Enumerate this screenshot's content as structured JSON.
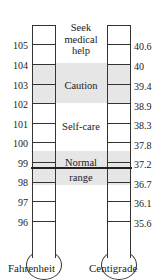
{
  "fahrenheit": {
    "title": "Fahrenheit",
    "ticks": [
      "105",
      "104",
      "103",
      "102",
      "101",
      "100",
      "99",
      "98",
      "97",
      "96"
    ]
  },
  "centigrade": {
    "title": "Centigrade",
    "ticks": [
      "40.6",
      "40",
      "39.4",
      "38.9",
      "38.3",
      "37.8",
      "37.2",
      "36.7",
      "36.1",
      "35.6"
    ]
  },
  "zones": {
    "seek_help": "Seek medical help",
    "caution": "Caution",
    "self_care": "Self-care",
    "normal": "Normal range"
  },
  "colors": {
    "band": "#e6e6e6",
    "line": "#333333"
  }
}
